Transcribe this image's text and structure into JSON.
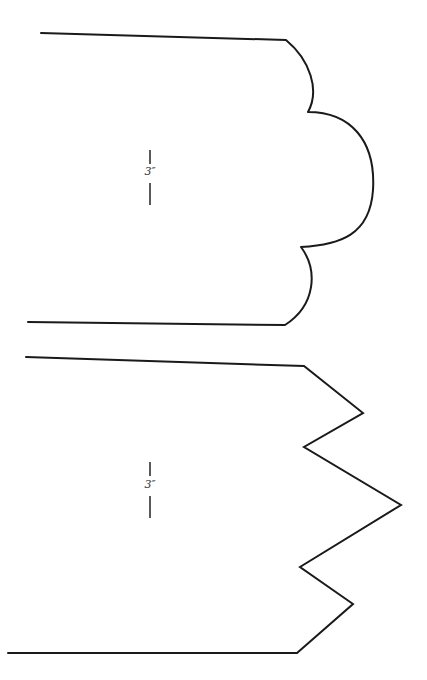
{
  "patterns": [
    {
      "name": "scalloped-edge-pattern",
      "dimension_label": "3″",
      "stroke_color": "#1a1a1a"
    },
    {
      "name": "zigzag-edge-pattern",
      "dimension_label": "3″",
      "stroke_color": "#1a1a1a"
    }
  ]
}
